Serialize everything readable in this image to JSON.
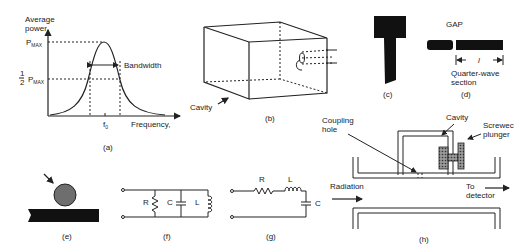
{
  "panels": {
    "a": {
      "caption": "(a)",
      "y_axis_label_line1": "Average",
      "y_axis_label_line2": "power",
      "pmax_label": "P",
      "pmax_sub": "MAX",
      "half_num": "1",
      "half_den": "2",
      "half_pmax_label": "P",
      "half_pmax_sub": "MAX",
      "bandwidth_label": "Bandwidth",
      "f0_label": "f",
      "f0_sub": "0",
      "x_axis_label": "Frequency,"
    },
    "b": {
      "caption": "(b)",
      "cavity_label": "Cavity"
    },
    "c": {
      "caption": "(c)"
    },
    "d": {
      "caption": "(d)",
      "gap_label": "GAP",
      "length_label": "l",
      "section_line1": "Quarter-wave",
      "section_line2": "section"
    },
    "e": {
      "caption": "(e)"
    },
    "f": {
      "caption": "(f)",
      "r_label": "R",
      "c_label": "C",
      "l_label": "L"
    },
    "g": {
      "caption": "(g)",
      "r_label": "R",
      "l_label": "L",
      "c_label": "C"
    },
    "h": {
      "caption": "(h)",
      "coupling_line1": "Coupling",
      "coupling_line2": "hole",
      "cavity_label": "Cavity",
      "plunger_line1": "Screwec",
      "plunger_line2": "plunger",
      "radiation_label": "Radiation",
      "detector_line1": "To",
      "detector_line2": "detector"
    }
  },
  "colors": {
    "ink": "#222222",
    "fill_dark": "#111111",
    "ball": "#6e6e6e",
    "plunger": "#555555"
  }
}
